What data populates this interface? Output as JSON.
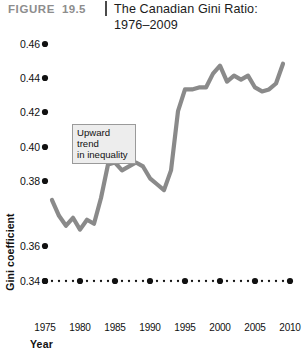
{
  "header": {
    "figure_label": "FIGURE",
    "figure_number": "19.5",
    "title_line1": "The Canadian Gini Ratio:",
    "title_line2": "1976–2009"
  },
  "annotation": {
    "line1": "Upward trend",
    "line2": "in inequality"
  },
  "axes": {
    "x_title": "Year",
    "y_title": "Gini coefficient"
  },
  "colors": {
    "line": "#8a8a8a",
    "tick_dot": "#111111",
    "figure_label": "#8d8d8d",
    "annotation_bg": "#ededed",
    "annotation_border": "#9a9a9a"
  },
  "chart_data": {
    "type": "line",
    "title": "The Canadian Gini Ratio: 1976–2009",
    "xlabel": "Year",
    "ylabel": "Gini coefficient",
    "xlim": [
      1975,
      2010
    ],
    "ylim": [
      0.34,
      0.46
    ],
    "xticks": [
      1975,
      1980,
      1985,
      1990,
      1995,
      2000,
      2005,
      2010
    ],
    "xtick_labels": [
      "1975",
      "1980",
      "1985",
      "1990",
      "1995",
      "2000",
      "2005",
      "2010"
    ],
    "yticks": [
      0.34,
      0.36,
      0.38,
      0.4,
      0.42,
      0.44,
      0.46
    ],
    "ytick_labels": [
      "0.34",
      "0.36",
      "0.38",
      "0.40",
      "0.42",
      "0.44",
      "0.46"
    ],
    "grid": false,
    "legend": false,
    "series": [
      {
        "name": "Gini coefficient",
        "x": [
          1976,
          1977,
          1978,
          1979,
          1980,
          1981,
          1982,
          1983,
          1984,
          1985,
          1986,
          1987,
          1988,
          1989,
          1990,
          1991,
          1992,
          1993,
          1994,
          1995,
          1996,
          1997,
          1998,
          1999,
          2000,
          2001,
          2002,
          2003,
          2004,
          2005,
          2006,
          2007,
          2008,
          2009
        ],
        "values": [
          0.381,
          0.373,
          0.368,
          0.372,
          0.366,
          0.371,
          0.369,
          0.382,
          0.399,
          0.4,
          0.396,
          0.398,
          0.4,
          0.398,
          0.392,
          0.389,
          0.386,
          0.396,
          0.426,
          0.437,
          0.437,
          0.438,
          0.438,
          0.445,
          0.449,
          0.441,
          0.444,
          0.442,
          0.444,
          0.438,
          0.436,
          0.437,
          0.44,
          0.45
        ]
      }
    ],
    "annotation": "Upward trend in inequality"
  }
}
